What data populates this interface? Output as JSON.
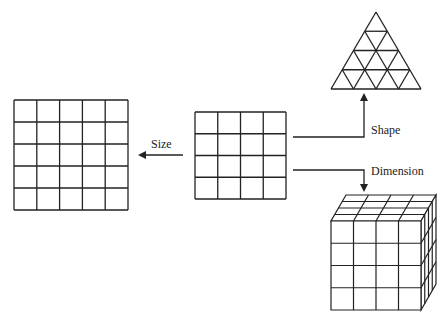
{
  "diagram": {
    "type": "transformation-diagram",
    "line_color": "#222222",
    "source": {
      "name": "center-grid",
      "rows": 4,
      "cols": 4
    },
    "transformations": [
      {
        "label": "Size",
        "direction": "left",
        "result": {
          "name": "larger-grid",
          "rows": 5,
          "cols": 5
        }
      },
      {
        "label": "Shape",
        "direction": "up-right",
        "result": {
          "name": "triangular-grid",
          "subdivisions": 4
        }
      },
      {
        "label": "Dimension",
        "direction": "down-right",
        "result": {
          "name": "cube-grid",
          "rows": 4,
          "cols": 4,
          "depth": 4
        }
      }
    ]
  }
}
